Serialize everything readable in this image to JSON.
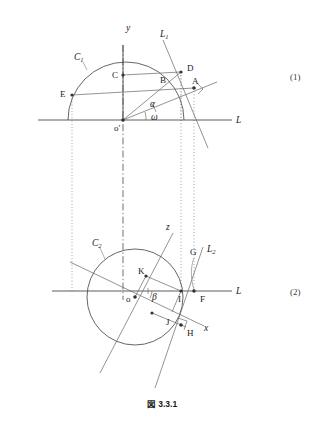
{
  "figure": {
    "caption": "図 3.3.1",
    "panels": [
      {
        "id": "panel-1",
        "number": "(1)"
      },
      {
        "id": "panel-2",
        "number": "(2)"
      }
    ]
  },
  "panel1": {
    "curve_label": "C",
    "curve_sub": "1",
    "axis_y": "y",
    "line_L": "L",
    "line_L1": "L",
    "line_L1_sub": "1",
    "origin": "o′",
    "angle_alpha": "α",
    "angle_omega": "ω",
    "points": [
      {
        "name": "C",
        "label": "C"
      },
      {
        "name": "B",
        "label": "B"
      },
      {
        "name": "D",
        "label": "D"
      },
      {
        "name": "A",
        "label": "A"
      },
      {
        "name": "E",
        "label": "E"
      }
    ]
  },
  "panel2": {
    "curve_label": "C",
    "curve_sub": "2",
    "axis_z": "z",
    "axis_x": "x",
    "line_L": "L",
    "line_L2": "L",
    "line_L2_sub": "2",
    "origin": "o",
    "angle_beta": "β",
    "points": [
      {
        "name": "K",
        "label": "K"
      },
      {
        "name": "I",
        "label": "I"
      },
      {
        "name": "J",
        "label": "J"
      },
      {
        "name": "H",
        "label": "H"
      },
      {
        "name": "G",
        "label": "G"
      },
      {
        "name": "F",
        "label": "F"
      }
    ]
  }
}
